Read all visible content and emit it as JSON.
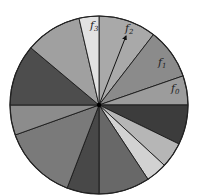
{
  "diagram": {
    "type": "pie-wheel",
    "center": [
      99,
      105
    ],
    "radius": 89,
    "sectors": [
      {
        "start": 0,
        "end": 37.7,
        "color": "#a9a9a9",
        "label": "f",
        "sub": "2"
      },
      {
        "start": 37.7,
        "end": 70.9,
        "color": "#8b8b8b",
        "label": "f",
        "sub": "1"
      },
      {
        "start": 70.9,
        "end": 90,
        "color": "#9c9c9c",
        "label": "f",
        "sub": "0"
      },
      {
        "start": 90,
        "end": 116,
        "color": "#3c3c3c",
        "label": "",
        "sub": ""
      },
      {
        "start": 116,
        "end": 132.7,
        "color": "#b6b6b6",
        "label": "",
        "sub": ""
      },
      {
        "start": 132.7,
        "end": 146.6,
        "color": "#d2d2d2",
        "label": "",
        "sub": ""
      },
      {
        "start": 146.6,
        "end": 180,
        "color": "#686868",
        "label": "",
        "sub": ""
      },
      {
        "start": 180,
        "end": 201,
        "color": "#484848",
        "label": "",
        "sub": ""
      },
      {
        "start": 201,
        "end": 250.3,
        "color": "#7a7a7a",
        "label": "",
        "sub": ""
      },
      {
        "start": 250.3,
        "end": 270,
        "color": "#8c8c8c",
        "label": "",
        "sub": ""
      },
      {
        "start": 270,
        "end": 310,
        "color": "#4d4d4d",
        "label": "",
        "sub": ""
      },
      {
        "start": 310,
        "end": 347,
        "color": "#a0a0a0",
        "label": "",
        "sub": ""
      },
      {
        "start": 347,
        "end": 360,
        "color": "#e2e2e2",
        "label": "f",
        "sub": "3"
      }
    ],
    "labels": [
      {
        "text": "f",
        "sub": "3",
        "x": 90,
        "y": 29
      },
      {
        "text": "f",
        "sub": "2",
        "x": 125,
        "y": 32
      },
      {
        "text": "f",
        "sub": "1",
        "x": 158,
        "y": 66
      },
      {
        "text": "f",
        "sub": "0",
        "x": 171,
        "y": 92
      }
    ],
    "arrow": {
      "from": [
        99,
        105
      ],
      "to": [
        126,
        36
      ]
    }
  }
}
